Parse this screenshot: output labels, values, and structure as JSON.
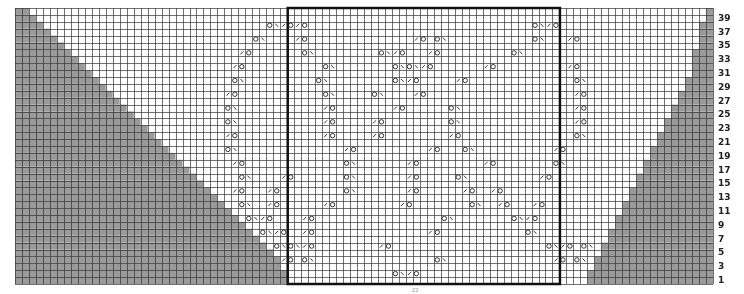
{
  "chart": {
    "type": "knitting-chart",
    "columns": 100,
    "rows": 40,
    "grid": {
      "left": 15,
      "top": 8,
      "right": 713,
      "bottom": 284
    },
    "colors": {
      "background": "#ffffff",
      "grid_line": "#333333",
      "shaded_no_stitch": "#9a9a9a",
      "box_outline": "#111111",
      "symbol": "#222222",
      "label": "#222222"
    },
    "repeat_box": {
      "col_start": 40,
      "col_end": 78,
      "row_start": 1,
      "row_end": 40
    },
    "left_shaded_edge_by_row": [
      39,
      39,
      38,
      38,
      37,
      36,
      35,
      34,
      33,
      32,
      31,
      30,
      29,
      28,
      27,
      26,
      25,
      24,
      23,
      22,
      21,
      20,
      19,
      18,
      17,
      16,
      15,
      14,
      13,
      12,
      11,
      10,
      9,
      8,
      7,
      6,
      5,
      4,
      3,
      2
    ],
    "right_shaded_start_by_row": [
      83,
      83,
      84,
      84,
      85,
      85,
      86,
      86,
      87,
      87,
      88,
      88,
      89,
      89,
      90,
      90,
      91,
      91,
      92,
      92,
      93,
      93,
      94,
      94,
      95,
      95,
      96,
      96,
      97,
      97,
      98,
      98,
      98,
      98,
      99,
      99,
      99,
      99,
      100,
      100
    ],
    "row_labels": [
      "1",
      "3",
      "5",
      "7",
      "9",
      "11",
      "13",
      "15",
      "17",
      "19",
      "21",
      "23",
      "25",
      "27",
      "29",
      "31",
      "33",
      "35",
      "37",
      "39"
    ],
    "legend": {
      "yo": "O = yarn over",
      "k2tog": "/ = k2tog",
      "ssk": "\\ = ssk",
      "shaded": "gray = no stitch"
    },
    "symbols": [
      {
        "row": 2,
        "col": 55,
        "s": "O\\/O"
      },
      {
        "row": 4,
        "col": 39,
        "s": "/O"
      },
      {
        "row": 4,
        "col": 42,
        "s": "O\\"
      },
      {
        "row": 4,
        "col": 61,
        "s": "O\\"
      },
      {
        "row": 4,
        "col": 78,
        "s": "/O"
      },
      {
        "row": 4,
        "col": 81,
        "s": "O\\"
      },
      {
        "row": 6,
        "col": 38,
        "s": "O\\O\\/O"
      },
      {
        "row": 6,
        "col": 53,
        "s": "/O"
      },
      {
        "row": 6,
        "col": 82,
        "s": "O\\"
      },
      {
        "row": 6,
        "col": 77,
        "s": "O\\/O"
      },
      {
        "row": 8,
        "col": 36,
        "s": "O\\/O"
      },
      {
        "row": 8,
        "col": 42,
        "s": "/O"
      },
      {
        "row": 8,
        "col": 60,
        "s": "/O"
      },
      {
        "row": 8,
        "col": 74,
        "s": "O\\"
      },
      {
        "row": 10,
        "col": 34,
        "s": "O\\/O"
      },
      {
        "row": 10,
        "col": 42,
        "s": "/O"
      },
      {
        "row": 10,
        "col": 62,
        "s": "O\\"
      },
      {
        "row": 10,
        "col": 72,
        "s": "O\\/O"
      },
      {
        "row": 12,
        "col": 33,
        "s": "O\\"
      },
      {
        "row": 12,
        "col": 37,
        "s": "/O"
      },
      {
        "row": 12,
        "col": 45,
        "s": "/O"
      },
      {
        "row": 12,
        "col": 56,
        "s": "/O"
      },
      {
        "row": 12,
        "col": 66,
        "s": "O\\"
      },
      {
        "row": 12,
        "col": 70,
        "s": "/O"
      },
      {
        "row": 12,
        "col": 75,
        "s": "/O"
      },
      {
        "row": 14,
        "col": 32,
        "s": "/O"
      },
      {
        "row": 14,
        "col": 37,
        "s": "/O"
      },
      {
        "row": 14,
        "col": 48,
        "s": "O\\"
      },
      {
        "row": 14,
        "col": 57,
        "s": "/O"
      },
      {
        "row": 14,
        "col": 65,
        "s": "/O"
      },
      {
        "row": 14,
        "col": 69,
        "s": "/O"
      },
      {
        "row": 16,
        "col": 33,
        "s": "O\\"
      },
      {
        "row": 16,
        "col": 39,
        "s": "/O"
      },
      {
        "row": 16,
        "col": 48,
        "s": "O\\"
      },
      {
        "row": 16,
        "col": 57,
        "s": "/O"
      },
      {
        "row": 16,
        "col": 64,
        "s": "O\\"
      },
      {
        "row": 16,
        "col": 76,
        "s": "/O"
      },
      {
        "row": 18,
        "col": 32,
        "s": "/O"
      },
      {
        "row": 18,
        "col": 48,
        "s": "O\\"
      },
      {
        "row": 18,
        "col": 57,
        "s": "/O"
      },
      {
        "row": 18,
        "col": 68,
        "s": "/O"
      },
      {
        "row": 18,
        "col": 78,
        "s": "O\\"
      },
      {
        "row": 20,
        "col": 31,
        "s": "O\\"
      },
      {
        "row": 20,
        "col": 48,
        "s": "/O"
      },
      {
        "row": 20,
        "col": 60,
        "s": "/O"
      },
      {
        "row": 20,
        "col": 65,
        "s": "O\\"
      },
      {
        "row": 20,
        "col": 78,
        "s": "/O"
      },
      {
        "row": 22,
        "col": 31,
        "s": "/O"
      },
      {
        "row": 22,
        "col": 45,
        "s": "/O"
      },
      {
        "row": 22,
        "col": 52,
        "s": "/O"
      },
      {
        "row": 22,
        "col": 63,
        "s": "/O"
      },
      {
        "row": 22,
        "col": 81,
        "s": "O\\"
      },
      {
        "row": 24,
        "col": 31,
        "s": "O\\"
      },
      {
        "row": 24,
        "col": 45,
        "s": "/O"
      },
      {
        "row": 24,
        "col": 52,
        "s": "/O"
      },
      {
        "row": 24,
        "col": 63,
        "s": "O\\"
      },
      {
        "row": 24,
        "col": 81,
        "s": "/O"
      },
      {
        "row": 26,
        "col": 31,
        "s": "O\\"
      },
      {
        "row": 26,
        "col": 45,
        "s": "/O"
      },
      {
        "row": 26,
        "col": 55,
        "s": "/O"
      },
      {
        "row": 26,
        "col": 63,
        "s": "O\\"
      },
      {
        "row": 26,
        "col": 81,
        "s": "/O"
      },
      {
        "row": 28,
        "col": 31,
        "s": "/O"
      },
      {
        "row": 28,
        "col": 45,
        "s": "O\\"
      },
      {
        "row": 28,
        "col": 52,
        "s": "O\\"
      },
      {
        "row": 28,
        "col": 58,
        "s": "/O"
      },
      {
        "row": 28,
        "col": 81,
        "s": "/O"
      },
      {
        "row": 30,
        "col": 32,
        "s": "O\\"
      },
      {
        "row": 30,
        "col": 44,
        "s": "O\\"
      },
      {
        "row": 30,
        "col": 55,
        "s": "O\\/O"
      },
      {
        "row": 30,
        "col": 64,
        "s": "/O"
      },
      {
        "row": 30,
        "col": 81,
        "s": "O\\"
      },
      {
        "row": 32,
        "col": 32,
        "s": "/O"
      },
      {
        "row": 32,
        "col": 45,
        "s": "O\\"
      },
      {
        "row": 32,
        "col": 55,
        "s": "O\\O\\/O"
      },
      {
        "row": 32,
        "col": 68,
        "s": "/O"
      },
      {
        "row": 32,
        "col": 80,
        "s": "/O"
      },
      {
        "row": 34,
        "col": 33,
        "s": "/O"
      },
      {
        "row": 34,
        "col": 42,
        "s": "O\\"
      },
      {
        "row": 34,
        "col": 53,
        "s": "O\\/O"
      },
      {
        "row": 34,
        "col": 60,
        "s": "/O"
      },
      {
        "row": 34,
        "col": 72,
        "s": "O\\"
      },
      {
        "row": 36,
        "col": 35,
        "s": "O\\"
      },
      {
        "row": 36,
        "col": 41,
        "s": "/O"
      },
      {
        "row": 36,
        "col": 58,
        "s": "/O"
      },
      {
        "row": 36,
        "col": 61,
        "s": "O\\"
      },
      {
        "row": 36,
        "col": 75,
        "s": "O\\"
      },
      {
        "row": 36,
        "col": 80,
        "s": "/O"
      },
      {
        "row": 38,
        "col": 37,
        "s": "O\\/O"
      },
      {
        "row": 38,
        "col": 41,
        "s": "/O"
      },
      {
        "row": 38,
        "col": 75,
        "s": "O\\/O"
      }
    ],
    "footer_text": "22"
  }
}
